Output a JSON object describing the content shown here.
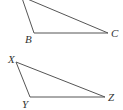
{
  "diagram": {
    "triangles": [
      {
        "name": "top-triangle",
        "vertices": [
          {
            "label": "",
            "x": 22,
            "y": -2
          },
          {
            "label": "B",
            "x": 34,
            "y": 33,
            "lx": 25,
            "ly": 43
          },
          {
            "label": "C",
            "x": 108,
            "y": 33,
            "lx": 111,
            "ly": 37
          }
        ]
      },
      {
        "name": "bottom-triangle",
        "vertices": [
          {
            "label": "X",
            "x": 16,
            "y": 62,
            "lx": 8,
            "ly": 63
          },
          {
            "label": "Y",
            "x": 30,
            "y": 97,
            "lx": 22,
            "ly": 108
          },
          {
            "label": "Z",
            "x": 105,
            "y": 97,
            "lx": 108,
            "ly": 101
          }
        ]
      }
    ],
    "labels": {
      "B": "B",
      "C": "C",
      "X": "X",
      "Y": "Y",
      "Z": "Z"
    },
    "stroke_color": "#555555"
  }
}
